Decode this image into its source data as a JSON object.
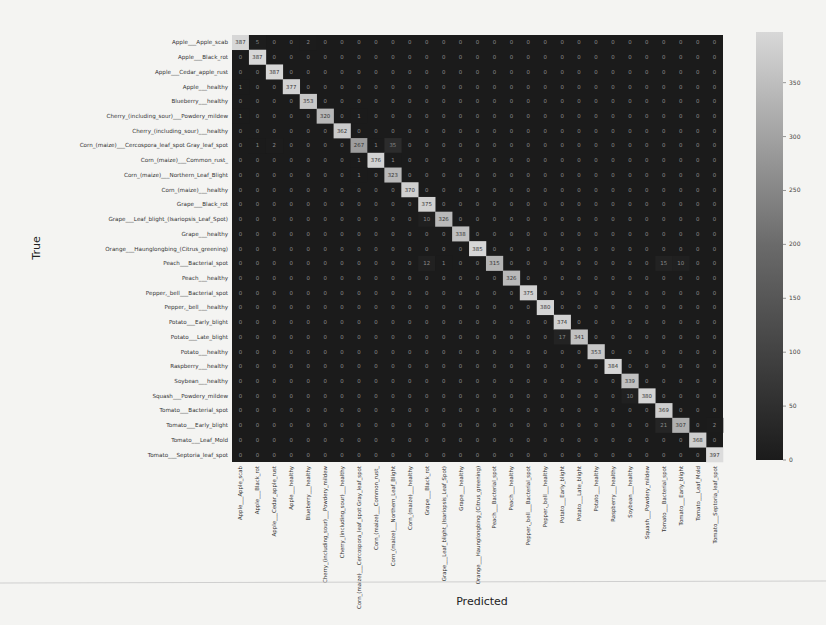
{
  "chart_data": {
    "type": "heatmap",
    "title": "",
    "xlabel": "Predicted",
    "ylabel": "True",
    "colormap": "grayscale (dark = low, light = high)",
    "colorbar": {
      "min": 0,
      "max": 397,
      "ticks": [
        0,
        50,
        100,
        150,
        200,
        250,
        300,
        350
      ]
    },
    "labels": [
      "Apple___Apple_scab",
      "Apple___Black_rot",
      "Apple___Cedar_apple_rust",
      "Apple___healthy",
      "Blueberry___healthy",
      "Cherry_(including_sour)___Powdery_mildew",
      "Cherry_(including_sour)___healthy",
      "Corn_(maize)___Cercospora_leaf_spot Gray_leaf_spot",
      "Corn_(maize)___Common_rust_",
      "Corn_(maize)___Northern_Leaf_Blight",
      "Corn_(maize)___healthy",
      "Grape___Black_rot",
      "Grape___Esca_(Black_Measles)",
      "Grape___Leaf_blight_(Isariopsis_Leaf_Spot)",
      "Grape___healthy",
      "Orange___Haunglongbing_(Citrus_greening)",
      "Peach___Bacterial_spot",
      "Peach___healthy",
      "Pepper,_bell___Bacterial_spot",
      "Pepper,_bell___healthy",
      "Potato___Early_blight",
      "Potato___Late_blight",
      "Potato___healthy",
      "Raspberry___healthy",
      "Soybean___healthy",
      "Squash___Powdery_mildew",
      "Tomato___Bacterial_spot",
      "Tomato___Early_blight",
      "Tomato___Leaf_Mold",
      "Tomato___Septoria_leaf_spot"
    ],
    "y_labels": [
      "Apple___Apple_scab",
      "Apple___Black_rot",
      "Apple___Cedar_apple_rust",
      "Apple___healthy",
      "Blueberry___healthy",
      "Cherry_(including_sour)___Powdery_mildew",
      "Cherry_(including_sour)___healthy",
      "Corn_(maize)___Cercospora_leaf_spot Gray_leaf_spot",
      "Corn_(maize)___Common_rust_",
      "Corn_(maize)___Northern_Leaf_Blight",
      "Corn_(maize)___healthy",
      "Grape___Black_rot",
      "Grape___Leaf_blight_(Isariopsis_Leaf_Spot)",
      "Grape___healthy",
      "Orange___Haunglongbing_(Citrus_greening)",
      "Peach___Bacterial_spot",
      "Peach___healthy",
      "Pepper,_bell___Bacterial_spot",
      "Pepper,_bell___healthy",
      "Potato___Early_blight",
      "Potato___Late_blight",
      "Potato___healthy",
      "Raspberry___healthy",
      "Soybean___healthy",
      "Squash___Powdery_mildew",
      "Tomato___Bacterial_spot",
      "Tomato___Early_blight",
      "Tomato___Leaf_Mold",
      "Tomato___Septoria_leaf_spot"
    ],
    "x_labels": [
      "Apple___Apple_scab",
      "Apple___Black_rot",
      "Apple___Cedar_apple_rust",
      "Apple___healthy",
      "Blueberry___healthy",
      "Cherry_(including_sour)___Powdery_mildew",
      "Cherry_(including_sour)___healthy",
      "Corn_(maize)___Cercospora_leaf_spot Gray_leaf_spot",
      "Corn_(maize)___Common_rust_",
      "Corn_(maize)___Northern_Leaf_Blight",
      "Corn_(maize)___healthy",
      "Grape___Black_rot",
      "Grape___Leaf_blight_(Isariopsis_Leaf_Spot)",
      "Grape___healthy",
      "Orange___Haunglongbing_(Citrus_greening)",
      "Peach___Bacterial_spot",
      "Peach___healthy",
      "Pepper,_bell___Bacterial_spot",
      "Pepper,_bell___healthy",
      "Potato___Early_blight",
      "Potato___Late_blight",
      "Potato___healthy",
      "Raspberry___healthy",
      "Soybean___healthy",
      "Squash___Powdery_mildew",
      "Tomato___Bacterial_spot",
      "Tomato___Early_blight",
      "Tomato___Leaf_Mold",
      "Tomato___Septoria_leaf_spot"
    ],
    "diagonal": [
      387,
      387,
      387,
      377,
      353,
      320,
      362,
      267,
      376,
      323,
      370,
      375,
      326,
      338,
      385,
      315,
      326,
      375,
      380,
      374,
      341,
      353,
      384,
      339,
      380,
      369,
      307,
      368,
      397
    ],
    "off_diagonal_nonzero": [
      {
        "row": 0,
        "col": 1,
        "value": 5
      },
      {
        "row": 0,
        "col": 4,
        "value": 2
      },
      {
        "row": 3,
        "col": 0,
        "value": 1
      },
      {
        "row": 5,
        "col": 0,
        "value": 1
      },
      {
        "row": 5,
        "col": 7,
        "value": 1
      },
      {
        "row": 7,
        "col": 1,
        "value": 1
      },
      {
        "row": 7,
        "col": 2,
        "value": 2
      },
      {
        "row": 7,
        "col": 8,
        "value": 1
      },
      {
        "row": 7,
        "col": 9,
        "value": 35
      },
      {
        "row": 8,
        "col": 7,
        "value": 1
      },
      {
        "row": 8,
        "col": 9,
        "value": 1
      },
      {
        "row": 9,
        "col": 7,
        "value": 1
      },
      {
        "row": 12,
        "col": 11,
        "value": 10
      },
      {
        "row": 15,
        "col": 11,
        "value": 12
      },
      {
        "row": 15,
        "col": 12,
        "value": 1
      },
      {
        "row": 15,
        "col": 25,
        "value": 15
      },
      {
        "row": 15,
        "col": 26,
        "value": 10
      },
      {
        "row": 20,
        "col": 19,
        "value": 17
      },
      {
        "row": 24,
        "col": 23,
        "value": 10
      },
      {
        "row": 26,
        "col": 25,
        "value": 21
      },
      {
        "row": 26,
        "col": 28,
        "value": 2
      }
    ]
  },
  "axes": {
    "xlabel": "Predicted",
    "ylabel": "True"
  }
}
